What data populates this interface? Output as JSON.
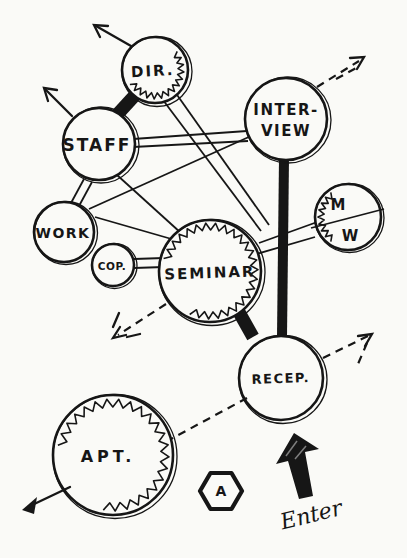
{
  "nodes": {
    "dir": {
      "label": "DIR."
    },
    "staff": {
      "label": "STAFF"
    },
    "interview": {
      "label_line1": "INTER-",
      "label_line2": "VIEW"
    },
    "work": {
      "label": "WORK"
    },
    "cop": {
      "label": "COP."
    },
    "seminar": {
      "label": "SEMINAR"
    },
    "mw": {
      "label_top": "M",
      "label_bottom": "W"
    },
    "recep": {
      "label": "RECEP."
    },
    "apt": {
      "label": "APT."
    }
  },
  "annotations": {
    "zone_marker": "A",
    "entry_label": "Enter"
  },
  "links": [
    {
      "from": "staff",
      "to": "dir",
      "style": "heavy"
    },
    {
      "from": "interview",
      "to": "recep",
      "style": "heavy"
    },
    {
      "from": "seminar",
      "to": "recep",
      "style": "heavy"
    },
    {
      "from": "staff",
      "to": "interview",
      "style": "double-line"
    },
    {
      "from": "staff",
      "to": "work",
      "style": "double-line"
    },
    {
      "from": "cop",
      "to": "seminar",
      "style": "double-line"
    },
    {
      "from": "seminar",
      "to": "mw",
      "style": "double-line"
    },
    {
      "from": "dir",
      "to": "seminar",
      "style": "wide-band"
    },
    {
      "from": "staff",
      "to": "seminar",
      "style": "line"
    },
    {
      "from": "work",
      "to": "seminar",
      "style": "line"
    },
    {
      "from": "work",
      "to": "interview",
      "style": "line"
    },
    {
      "from": "recep",
      "to": "apt",
      "style": "dashed"
    },
    {
      "from": "recep",
      "to": "outside-right",
      "style": "dashed-arrow"
    },
    {
      "from": "seminar",
      "to": "outside-lower-left",
      "style": "dashed-arrow"
    },
    {
      "from": "interview",
      "to": "outside-upper-right",
      "style": "dashed-arrow"
    },
    {
      "from": "dir",
      "to": "outside-upper-left",
      "style": "arrow"
    },
    {
      "from": "staff",
      "to": "outside-upper-left",
      "style": "arrow"
    },
    {
      "from": "apt",
      "to": "outside-lower-left",
      "style": "arrow"
    }
  ],
  "colors": {
    "ink": "#161616",
    "paper": "#fafaf7"
  }
}
